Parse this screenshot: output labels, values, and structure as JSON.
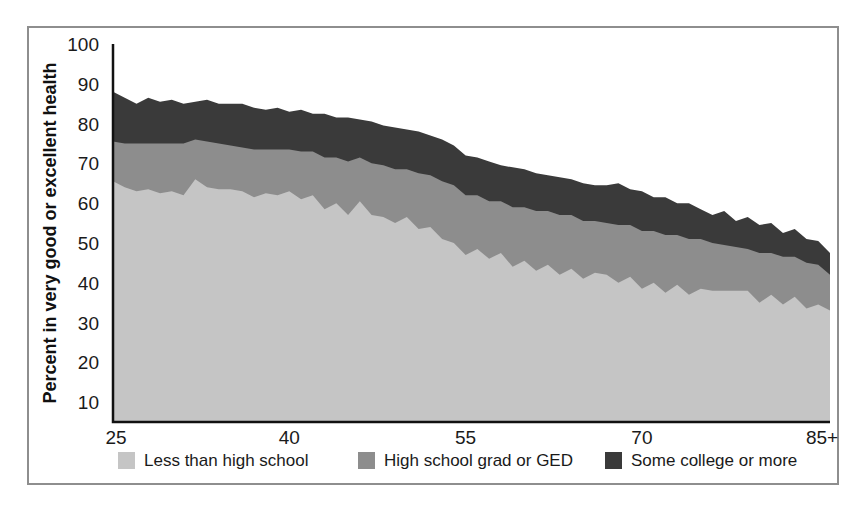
{
  "chart_data": {
    "type": "area",
    "stacked": true,
    "title": "",
    "subtitle": "",
    "xlabel": "",
    "ylabel": "Percent in very good or excellent health",
    "xlim": [
      25,
      86
    ],
    "ylim": [
      5,
      100
    ],
    "grid": false,
    "legend_position": "bottom",
    "xtick_labels": [
      "25",
      "40",
      "55",
      "70",
      "85+"
    ],
    "xtick_values": [
      25,
      40,
      55,
      70,
      86
    ],
    "ytick_labels": [
      "10",
      "20",
      "30",
      "40",
      "50",
      "60",
      "70",
      "80",
      "90",
      "100"
    ],
    "ytick_values": [
      10,
      20,
      30,
      40,
      50,
      60,
      70,
      80,
      90,
      100
    ],
    "x": [
      25,
      26,
      27,
      28,
      29,
      30,
      31,
      32,
      33,
      34,
      35,
      36,
      37,
      38,
      39,
      40,
      41,
      42,
      43,
      44,
      45,
      46,
      47,
      48,
      49,
      50,
      51,
      52,
      53,
      54,
      55,
      56,
      57,
      58,
      59,
      60,
      61,
      62,
      63,
      64,
      65,
      66,
      67,
      68,
      69,
      70,
      71,
      72,
      73,
      74,
      75,
      76,
      77,
      78,
      79,
      80,
      81,
      82,
      83,
      84,
      85,
      86
    ],
    "series": [
      {
        "name": "Less than high school",
        "color": "#c5c5c5",
        "values": [
          65.5,
          64.0,
          63.0,
          63.5,
          62.5,
          63.0,
          62.0,
          66.0,
          64.0,
          63.5,
          63.5,
          63.0,
          61.5,
          62.5,
          62.0,
          63.0,
          61.0,
          62.0,
          58.5,
          60.0,
          57.0,
          60.5,
          57.0,
          56.5,
          55.0,
          56.5,
          53.5,
          54.0,
          51.0,
          50.0,
          47.0,
          48.5,
          46.0,
          47.5,
          44.0,
          45.5,
          43.0,
          44.5,
          42.0,
          43.5,
          41.0,
          42.5,
          42.0,
          40.0,
          41.5,
          38.5,
          40.0,
          37.5,
          39.5,
          37.0,
          38.5,
          38.0,
          38.0,
          38.0,
          38.0,
          35.0,
          37.0,
          34.5,
          36.5,
          33.5,
          34.5,
          33.0
        ]
      },
      {
        "name": "High school grad or GED",
        "color": "#8d8d8d",
        "values": [
          10.0,
          11.0,
          12.0,
          11.5,
          12.5,
          12.0,
          13.0,
          10.0,
          11.5,
          11.5,
          11.0,
          11.0,
          12.0,
          11.0,
          11.5,
          10.5,
          12.0,
          11.0,
          13.0,
          11.5,
          13.5,
          11.0,
          13.0,
          13.0,
          13.5,
          12.0,
          14.0,
          13.0,
          14.5,
          14.5,
          15.0,
          13.5,
          14.5,
          13.0,
          15.0,
          13.5,
          15.0,
          13.5,
          15.0,
          13.5,
          14.5,
          13.0,
          13.0,
          14.5,
          13.0,
          14.5,
          13.0,
          14.5,
          12.5,
          14.0,
          12.5,
          12.0,
          11.5,
          11.0,
          10.5,
          12.5,
          10.5,
          12.0,
          10.0,
          11.5,
          10.0,
          9.0
        ]
      },
      {
        "name": "Some college or more",
        "color": "#3a3a3a",
        "values": [
          12.5,
          11.5,
          10.0,
          11.5,
          10.5,
          11.0,
          10.0,
          9.5,
          10.5,
          10.0,
          10.5,
          11.0,
          10.5,
          10.0,
          10.5,
          9.5,
          10.5,
          9.5,
          11.0,
          10.0,
          11.0,
          9.5,
          10.5,
          10.0,
          10.5,
          10.0,
          10.5,
          10.0,
          10.5,
          10.0,
          10.0,
          9.5,
          10.0,
          9.0,
          10.0,
          9.5,
          9.5,
          9.0,
          9.5,
          9.0,
          9.5,
          9.0,
          9.5,
          10.5,
          9.0,
          10.0,
          8.5,
          9.5,
          8.0,
          9.0,
          7.5,
          7.0,
          8.5,
          6.5,
          8.0,
          7.0,
          7.5,
          6.0,
          7.0,
          6.0,
          6.0,
          5.5
        ]
      }
    ],
    "legend": [
      {
        "label": "Less than high school",
        "color": "#c5c5c5"
      },
      {
        "label": "High school grad or GED",
        "color": "#8d8d8d"
      },
      {
        "label": "Some college or more",
        "color": "#3a3a3a"
      }
    ]
  },
  "colors": {
    "less_than_high_school": "#c5c5c5",
    "high_school_grad": "#8d8d8d",
    "some_college": "#3a3a3a",
    "axis": "#111111",
    "frame": "#8e8e8e",
    "background": "#ffffff"
  }
}
